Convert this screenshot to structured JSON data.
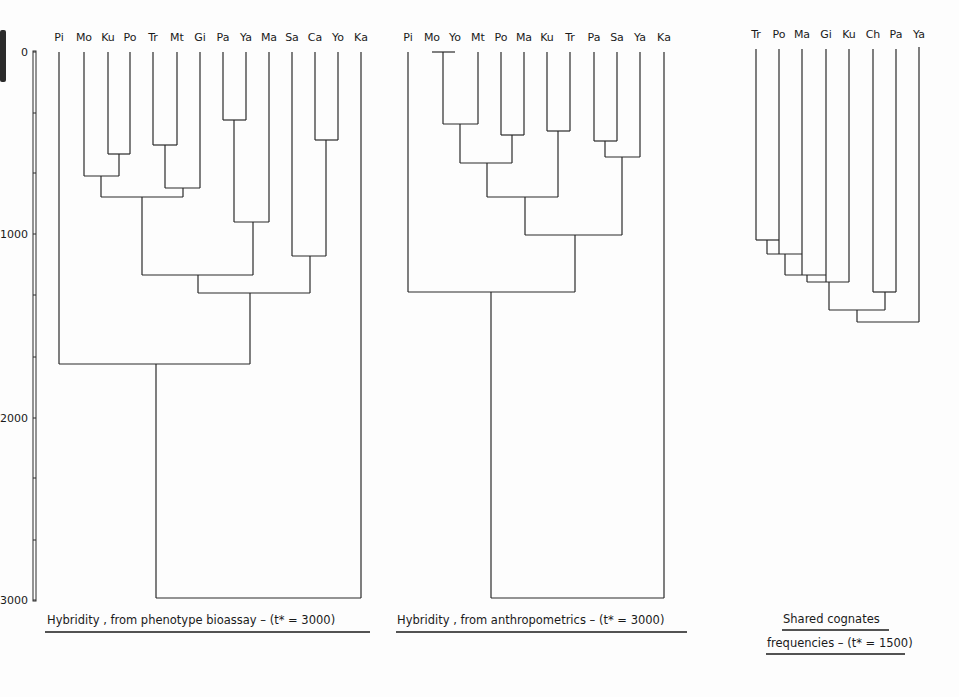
{
  "figure": {
    "axis": {
      "ticks": [
        {
          "label": "0",
          "y": 52
        },
        {
          "label": "1000",
          "y": 234
        },
        {
          "label": "2000",
          "y": 418
        },
        {
          "label": "3000",
          "y": 600
        }
      ],
      "minor_ticks_y": [
        113,
        173,
        295,
        357,
        478,
        540
      ]
    },
    "panels": [
      {
        "id": "phenotype",
        "caption": "Hybridity , from phenotype bioassay – (t* = 3000)",
        "caption_x": 47,
        "caption_y": 624,
        "underline": [
          45,
          370,
          632
        ]
      },
      {
        "id": "anthropometrics",
        "caption": "Hybridity , from anthropometrics – (t* = 3000)",
        "caption_x": 397,
        "caption_y": 624,
        "underline": [
          396,
          687,
          632
        ]
      },
      {
        "id": "cognates",
        "caption_line1": "Shared cognates",
        "caption_line2": "frequencies – (t* = 1500)",
        "caption1_x": 783,
        "caption1_y": 623,
        "underline1": [
          782,
          889,
          630
        ],
        "caption2_x": 767,
        "caption2_y": 647,
        "underline2": [
          766,
          905,
          654
        ]
      }
    ]
  },
  "chart_data": [
    {
      "type": "dendrogram",
      "title": "Hybridity, from phenotype bioassay – (t* = 3000)",
      "ylabel": "distance",
      "ylim": [
        0,
        3000
      ],
      "ytick_labels": [
        "0",
        "1000",
        "2000",
        "3000"
      ],
      "leaves": [
        "Pi",
        "Mo",
        "Ku",
        "Po",
        "Tr",
        "Mt",
        "Gi",
        "Pa",
        "Ya",
        "Ma",
        "Sa",
        "Ca",
        "Yo",
        "Ka"
      ],
      "leaf_x": [
        59,
        84,
        108,
        130,
        153,
        177,
        200,
        223,
        246,
        269,
        292,
        315,
        338,
        361
      ],
      "merges": [
        {
          "left": "Ku",
          "right": "Po",
          "height": 560
        },
        {
          "left": "Tr",
          "right": "Mt",
          "height": 510
        },
        {
          "left": "Pa",
          "right": "Ya",
          "height": 370
        },
        {
          "left": "Ca",
          "right": "Yo",
          "height": 480
        },
        {
          "left": "Mo",
          "right": "(Ku,Po)",
          "height": 680
        },
        {
          "left": "(Tr,Mt)",
          "right": "Gi",
          "height": 740
        },
        {
          "left": "(Mo,Ku,Po)",
          "right": "(Tr,Mt,Gi)",
          "height": 790
        },
        {
          "left": "(Pa,Ya)",
          "right": "Ma",
          "height": 930
        },
        {
          "left": "Sa",
          "right": "(Ca,Yo)",
          "height": 1120
        },
        {
          "left": "(Mo..Gi)",
          "right": "(Pa,Ya,Ma)",
          "height": 1220
        },
        {
          "left": "(Mo..Ma)",
          "right": "(Sa,Ca,Yo)",
          "height": 1320
        },
        {
          "left": "Pi",
          "right": "(Mo..Yo)",
          "height": 1710
        },
        {
          "left": "(Pi..Yo)",
          "right": "Ka",
          "height": 3000
        }
      ],
      "segments": [
        [
          59,
          52,
          59,
          364
        ],
        [
          84,
          52,
          84,
          176
        ],
        [
          108,
          52,
          108,
          154
        ],
        [
          130,
          52,
          130,
          154
        ],
        [
          153,
          52,
          153,
          145
        ],
        [
          177,
          52,
          177,
          145
        ],
        [
          200,
          52,
          200,
          188
        ],
        [
          223,
          52,
          223,
          120
        ],
        [
          246,
          52,
          246,
          120
        ],
        [
          269,
          52,
          269,
          222
        ],
        [
          292,
          52,
          292,
          256
        ],
        [
          315,
          52,
          315,
          140
        ],
        [
          338,
          52,
          338,
          140
        ],
        [
          361,
          52,
          361,
          598
        ],
        [
          108,
          154,
          130,
          154
        ],
        [
          119,
          154,
          119,
          176
        ],
        [
          153,
          145,
          177,
          145
        ],
        [
          165,
          145,
          165,
          188
        ],
        [
          223,
          120,
          246,
          120
        ],
        [
          234,
          120,
          234,
          222
        ],
        [
          315,
          140,
          338,
          140
        ],
        [
          326,
          140,
          326,
          256
        ],
        [
          84,
          176,
          119,
          176
        ],
        [
          101,
          176,
          101,
          197
        ],
        [
          165,
          188,
          200,
          188
        ],
        [
          183,
          188,
          183,
          197
        ],
        [
          101,
          197,
          183,
          197
        ],
        [
          142,
          197,
          142,
          275
        ],
        [
          234,
          222,
          269,
          222
        ],
        [
          253,
          222,
          253,
          275
        ],
        [
          292,
          256,
          326,
          256
        ],
        [
          310,
          256,
          310,
          293
        ],
        [
          142,
          275,
          253,
          275
        ],
        [
          198,
          275,
          198,
          293
        ],
        [
          198,
          293,
          310,
          293
        ],
        [
          250,
          293,
          250,
          364
        ],
        [
          59,
          364,
          250,
          364
        ],
        [
          156,
          364,
          156,
          598
        ],
        [
          156,
          598,
          361,
          598
        ]
      ]
    },
    {
      "type": "dendrogram",
      "title": "Hybridity, from anthropometrics – (t* = 3000)",
      "ylabel": "distance",
      "ylim": [
        0,
        3000
      ],
      "leaves": [
        "Pi",
        "Mo",
        "Yo",
        "Mt",
        "Po",
        "Ma",
        "Ku",
        "Tr",
        "Pa",
        "Sa",
        "Ya",
        "Ka"
      ],
      "leaf_label_x": [
        408,
        432,
        455,
        478,
        501,
        524,
        547,
        570,
        594,
        617,
        640,
        664
      ],
      "merges": [
        {
          "left": "Mo",
          "right": "Yo",
          "height": 0
        },
        {
          "left": "(Mo,Yo)",
          "right": "Mt",
          "height": 400
        },
        {
          "left": "Po",
          "right": "Ma",
          "height": 460
        },
        {
          "left": "Ku",
          "right": "Tr",
          "height": 430
        },
        {
          "left": "Pa",
          "right": "Sa",
          "height": 490
        },
        {
          "left": "(Pa,Sa)",
          "right": "Ya",
          "height": 580
        },
        {
          "left": "(Mo,Yo,Mt)",
          "right": "(Po,Ma)",
          "height": 610
        },
        {
          "left": "(Mo..Ma)",
          "right": "(Ku,Tr)",
          "height": 790
        },
        {
          "left": "(Mo..Tr)",
          "right": "(Pa,Sa,Ya)",
          "height": 1000
        },
        {
          "left": "Pi",
          "right": "(Mo..Ya)",
          "height": 1310
        },
        {
          "left": "(Pi..Ya)",
          "right": "Ka",
          "height": 3000
        }
      ],
      "segments": [
        [
          432,
          52,
          455,
          52
        ],
        [
          443,
          52,
          443,
          124
        ],
        [
          408,
          52,
          408,
          292
        ],
        [
          478,
          52,
          478,
          124
        ],
        [
          501,
          52,
          501,
          135
        ],
        [
          524,
          52,
          524,
          135
        ],
        [
          547,
          52,
          547,
          131
        ],
        [
          570,
          52,
          570,
          131
        ],
        [
          594,
          52,
          594,
          141
        ],
        [
          617,
          52,
          617,
          141
        ],
        [
          640,
          52,
          640,
          157
        ],
        [
          664,
          52,
          664,
          598
        ],
        [
          443,
          124,
          478,
          124
        ],
        [
          460,
          124,
          460,
          163
        ],
        [
          501,
          135,
          524,
          135
        ],
        [
          512,
          135,
          512,
          163
        ],
        [
          547,
          131,
          570,
          131
        ],
        [
          558,
          131,
          558,
          197
        ],
        [
          594,
          141,
          617,
          141
        ],
        [
          605,
          141,
          605,
          157
        ],
        [
          605,
          157,
          640,
          157
        ],
        [
          622,
          157,
          622,
          235
        ],
        [
          460,
          163,
          512,
          163
        ],
        [
          487,
          163,
          487,
          197
        ],
        [
          487,
          197,
          558,
          197
        ],
        [
          525,
          197,
          525,
          235
        ],
        [
          525,
          235,
          622,
          235
        ],
        [
          575,
          235,
          575,
          292
        ],
        [
          408,
          292,
          575,
          292
        ],
        [
          491,
          292,
          491,
          598
        ],
        [
          491,
          598,
          664,
          598
        ]
      ]
    },
    {
      "type": "dendrogram",
      "title": "Shared cognates frequencies – (t* = 1500)",
      "ylabel": "distance",
      "leaves": [
        "Tr",
        "Po",
        "Ma",
        "Gi",
        "Ku",
        "Ch",
        "Pa",
        "Ya"
      ],
      "leaf_x": [
        756,
        779,
        802,
        826,
        849,
        873,
        896,
        919
      ],
      "merges": [
        {
          "left": "Tr",
          "right": "Po",
          "height": 1030
        },
        {
          "left": "(Tr,Po)",
          "right": "Ma",
          "height": 1100
        },
        {
          "left": "(Tr,Po,Ma)",
          "right": "Gi",
          "height": 1220
        },
        {
          "left": "(Tr..Gi)",
          "right": "Ku",
          "height": 1260
        },
        {
          "left": "Ch",
          "right": "Pa",
          "height": 1310
        },
        {
          "left": "(Tr..Ku)",
          "right": "(Ch,Pa)",
          "height": 1410
        },
        {
          "left": "(Tr..Pa)",
          "right": "Ya",
          "height": 1480
        }
      ],
      "segments": [
        [
          756,
          49,
          756,
          240
        ],
        [
          779,
          49,
          779,
          254
        ],
        [
          802,
          49,
          802,
          275
        ],
        [
          826,
          49,
          826,
          282
        ],
        [
          849,
          49,
          849,
          282
        ],
        [
          873,
          49,
          873,
          292
        ],
        [
          896,
          49,
          896,
          292
        ],
        [
          919,
          47,
          919,
          322
        ],
        [
          756,
          240,
          779,
          240
        ],
        [
          767,
          240,
          767,
          254
        ],
        [
          767,
          254,
          802,
          254
        ],
        [
          785,
          254,
          785,
          275
        ],
        [
          785,
          275,
          826,
          275
        ],
        [
          807,
          275,
          807,
          282
        ],
        [
          807,
          282,
          849,
          282
        ],
        [
          829,
          282,
          829,
          310
        ],
        [
          873,
          292,
          896,
          292
        ],
        [
          885,
          292,
          885,
          310
        ],
        [
          829,
          310,
          885,
          310
        ],
        [
          857,
          310,
          857,
          322
        ],
        [
          857,
          322,
          919,
          322
        ]
      ]
    }
  ]
}
